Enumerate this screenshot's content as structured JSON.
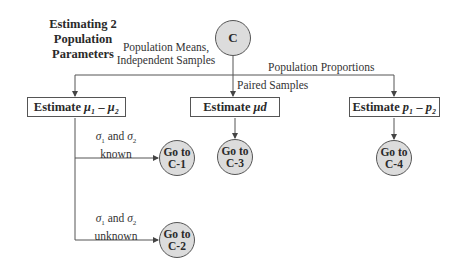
{
  "title": {
    "line1": "Estimating 2",
    "line2": "Population Parameters"
  },
  "start_node": {
    "label": "C"
  },
  "branches": {
    "means_independent": {
      "line1": "Population Means,",
      "line2": "Independent Samples"
    },
    "paired": {
      "label": "Paired Samples"
    },
    "proportions": {
      "label": "Population Proportions"
    }
  },
  "boxes": [
    {
      "prefix": "Estimate",
      "symbol": "μ₁ – μ₂"
    },
    {
      "prefix": "Estimate",
      "symbol": "μd"
    },
    {
      "prefix": "Estimate",
      "symbol": "p₁ – p₂"
    }
  ],
  "conditions": [
    {
      "line1_a": "σ",
      "line1_a_sub": "1",
      "line1_mid": " and ",
      "line1_b": "σ",
      "line1_b_sub": "2",
      "line2": "known"
    },
    {
      "line1_a": "σ",
      "line1_a_sub": "1",
      "line1_mid": " and ",
      "line1_b": "σ",
      "line1_b_sub": "2",
      "line2": "unknown"
    }
  ],
  "goto_nodes": [
    {
      "line1": "Go to",
      "line2": "C-1"
    },
    {
      "line1": "Go to",
      "line2": "C-2"
    },
    {
      "line1": "Go to",
      "line2": "C-3"
    },
    {
      "line1": "Go to",
      "line2": "C-4"
    }
  ],
  "colors": {
    "node_fill": "#dcdcdc",
    "line": "#555555",
    "text": "#2a2a2a"
  }
}
